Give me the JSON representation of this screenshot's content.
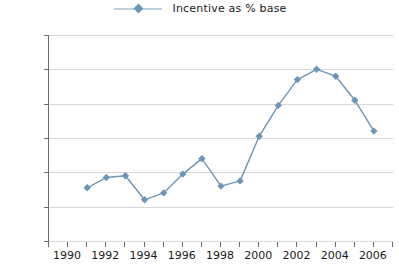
{
  "legend": {
    "entries": [
      {
        "label": "Incentive as % base",
        "color": "#6f95b5",
        "marker": "diamond"
      }
    ],
    "position": "top-center"
  },
  "axes": {
    "y": {
      "ticks": [
        "0%",
        "20%",
        "40%",
        "60%",
        "80%",
        "100%",
        "120%"
      ],
      "min": 0,
      "max": 120,
      "step": 20,
      "grid": true
    },
    "x": {
      "labels": [
        "1990",
        "1992",
        "1994",
        "1996",
        "1998",
        "2000",
        "2002",
        "2004",
        "2006"
      ],
      "tick_years": [
        1989,
        1990,
        1991,
        1992,
        1993,
        1994,
        1995,
        1996,
        1997,
        1998,
        1999,
        2000,
        2001,
        2002,
        2003,
        2004,
        2005,
        2006,
        2007
      ],
      "min": 1989,
      "max": 2007,
      "grid": false
    }
  },
  "colors": {
    "series": "#6f95b5",
    "grid": "#d7d7d7",
    "axis": "#6b6b6b",
    "text": "#1a1a1a",
    "background": "#ffffff"
  },
  "chart_data": {
    "type": "line",
    "title": "",
    "subtitle": "",
    "xlabel": "",
    "ylabel": "",
    "xlim": [
      1989,
      2007
    ],
    "ylim": [
      0,
      120
    ],
    "ytick_labels": [
      "0%",
      "20%",
      "40%",
      "60%",
      "80%",
      "100%",
      "120%"
    ],
    "xtick_labels": [
      "1990",
      "1992",
      "1994",
      "1996",
      "1998",
      "2000",
      "2002",
      "2004",
      "2006"
    ],
    "grid": "horizontal",
    "legend_position": "top-center",
    "x": [
      1991,
      1992,
      1993,
      1994,
      1995,
      1996,
      1997,
      1998,
      1999,
      2000,
      2001,
      2002,
      2003,
      2004,
      2005,
      2006
    ],
    "series": [
      {
        "name": "Incentive as % base",
        "color": "#6f95b5",
        "marker": "diamond",
        "values": [
          31,
          37,
          38,
          24,
          28,
          39,
          48,
          32,
          35,
          61,
          79,
          94,
          100,
          96,
          82,
          64
        ],
        "units": "%"
      }
    ]
  }
}
